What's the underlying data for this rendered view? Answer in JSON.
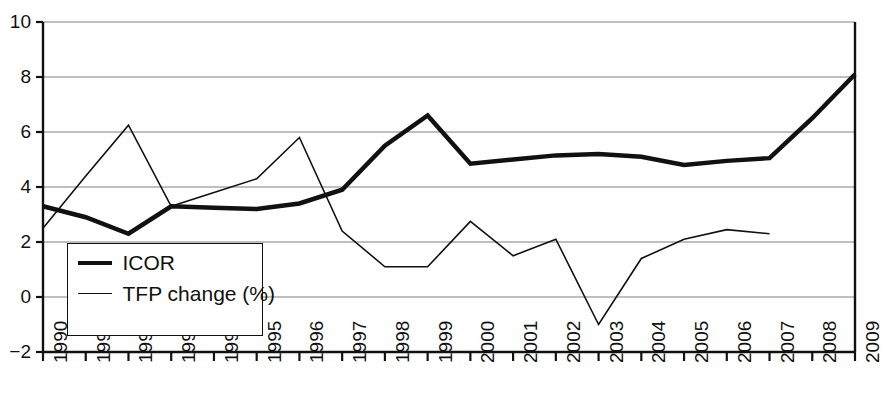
{
  "chart_data": {
    "type": "line",
    "title": "",
    "subtitle": "",
    "xlabel": "",
    "ylabel": "",
    "grid": true,
    "legend_position": "inside-lower-left",
    "xlim": [
      1990,
      2009
    ],
    "ylim": [
      -2,
      10
    ],
    "yticks": [
      -2,
      0,
      2,
      4,
      6,
      8,
      10
    ],
    "ytick_labels": [
      "−2",
      "0",
      "2",
      "4",
      "6",
      "8",
      "10"
    ],
    "categories": [
      1990,
      1991,
      1992,
      1993,
      1994,
      1995,
      1996,
      1997,
      1998,
      1999,
      2000,
      2001,
      2002,
      2003,
      2004,
      2005,
      2006,
      2007,
      2008,
      2009
    ],
    "xtick_labels": [
      "1990",
      "1991",
      "1992",
      "1993",
      "1994",
      "1995",
      "1996",
      "1997",
      "1998",
      "1999",
      "2000",
      "2001",
      "2002",
      "2003",
      "2004",
      "2005",
      "2006",
      "2007",
      "2008",
      "2009"
    ],
    "series": [
      {
        "name": "ICOR",
        "style": "thick",
        "color": "#111111",
        "linewidth": 4.5,
        "values": [
          3.3,
          2.9,
          2.3,
          3.3,
          3.25,
          3.2,
          3.4,
          3.9,
          5.5,
          6.6,
          4.85,
          5.0,
          5.15,
          5.2,
          5.1,
          4.8,
          4.95,
          5.05,
          6.5,
          8.1
        ]
      },
      {
        "name": "TFP change (%)",
        "style": "thin",
        "color": "#111111",
        "linewidth": 1.6,
        "values": [
          2.5,
          4.4,
          6.25,
          3.3,
          3.8,
          4.3,
          5.8,
          2.4,
          1.1,
          1.1,
          2.75,
          1.5,
          2.1,
          -1.0,
          1.4,
          2.1,
          2.45,
          2.3,
          null,
          null
        ]
      }
    ]
  },
  "legend": {
    "items": [
      {
        "label": "ICOR",
        "style": "thick"
      },
      {
        "label": "TFP change (%)",
        "style": "thin"
      }
    ]
  },
  "axes": {
    "axis_color": "#111111",
    "grid_color": "#808080"
  }
}
